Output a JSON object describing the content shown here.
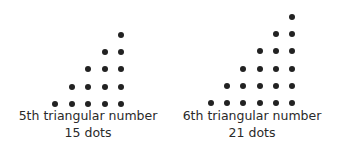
{
  "figures": [
    {
      "ordinal_label": "5th triangular number",
      "count_label": "15 dots",
      "n": 5,
      "dots": 15,
      "origin_x": 55,
      "base_y": 104,
      "spacing_x": 16.5,
      "spacing_y": 17.3,
      "caption_center_x": 88
    },
    {
      "ordinal_label": "6th triangular number",
      "count_label": "21 dots",
      "n": 6,
      "dots": 21,
      "origin_x": 211,
      "base_y": 103,
      "spacing_x": 16.2,
      "spacing_y": 17.2,
      "caption_center_x": 252
    }
  ],
  "colors": {
    "dot": "#222222",
    "text": "#2a2a2a",
    "background": "#ffffff"
  }
}
